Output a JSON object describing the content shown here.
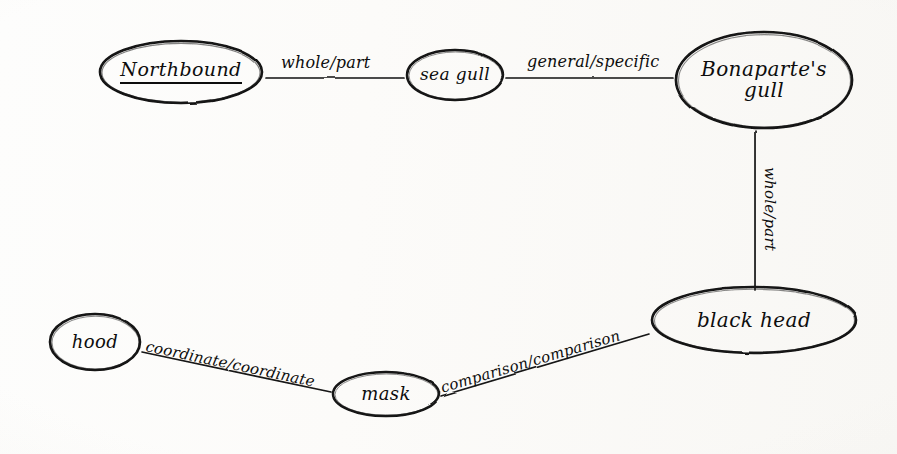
{
  "diagram": {
    "style": "hand-drawn ink on paper",
    "ink_color": "#0d0d0d",
    "paper_color": "#fdfdfc",
    "nodes": [
      {
        "id": "northbound",
        "label": "Northbound",
        "shape": "ellipse",
        "underlined": true,
        "cx": 181,
        "cy": 72,
        "rx": 85,
        "ry": 35,
        "font_size": 19
      },
      {
        "id": "seagull",
        "label": "sea gull",
        "shape": "ellipse",
        "underlined": false,
        "cx": 455,
        "cy": 75,
        "rx": 51,
        "ry": 28,
        "font_size": 17
      },
      {
        "id": "bonapartes_gull",
        "label": "Bonaparte's\ngull",
        "shape": "ellipse",
        "underlined": false,
        "cx": 764,
        "cy": 80,
        "rx": 92,
        "ry": 52,
        "font_size": 20
      },
      {
        "id": "black_head",
        "label": "black head",
        "shape": "ellipse",
        "underlined": false,
        "cx": 754,
        "cy": 320,
        "rx": 106,
        "ry": 37,
        "font_size": 20
      },
      {
        "id": "mask",
        "label": "mask",
        "shape": "ellipse",
        "underlined": false,
        "cx": 386,
        "cy": 394,
        "rx": 56,
        "ry": 25,
        "font_size": 18
      },
      {
        "id": "hood",
        "label": "hood",
        "shape": "ellipse",
        "underlined": false,
        "cx": 95,
        "cy": 342,
        "rx": 48,
        "ry": 31,
        "font_size": 18
      }
    ],
    "edges": [
      {
        "id": "northbound-seagull",
        "from": "northbound",
        "to": "seagull",
        "label": "whole/part",
        "x1": 266,
        "y1": 78,
        "x2": 404,
        "y2": 78,
        "label_x": 281,
        "label_y": 62,
        "label_rotate": 0
      },
      {
        "id": "seagull-bonapartes",
        "from": "seagull",
        "to": "bonapartes_gull",
        "label": "general/specific",
        "x1": 506,
        "y1": 78,
        "x2": 673,
        "y2": 78,
        "label_x": 527,
        "label_y": 60,
        "label_rotate": 0
      },
      {
        "id": "bonapartes-blackhead",
        "from": "bonapartes_gull",
        "to": "black_head",
        "label": "whole/part",
        "x1": 755,
        "y1": 131,
        "x2": 755,
        "y2": 290,
        "label_x": 772,
        "label_y": 160,
        "label_rotate": 90
      },
      {
        "id": "blackhead-mask",
        "from": "black_head",
        "to": "mask",
        "label": "comparison/comparison",
        "x1": 649,
        "y1": 334,
        "x2": 441,
        "y2": 396,
        "label_x": 440,
        "label_y": 388,
        "label_rotate": -16
      },
      {
        "id": "mask-hood",
        "from": "mask",
        "to": "hood",
        "label": "coordinate/coordinate",
        "x1": 331,
        "y1": 392,
        "x2": 142,
        "y2": 352,
        "label_x": 145,
        "label_y": 345,
        "label_rotate": 12
      }
    ]
  }
}
